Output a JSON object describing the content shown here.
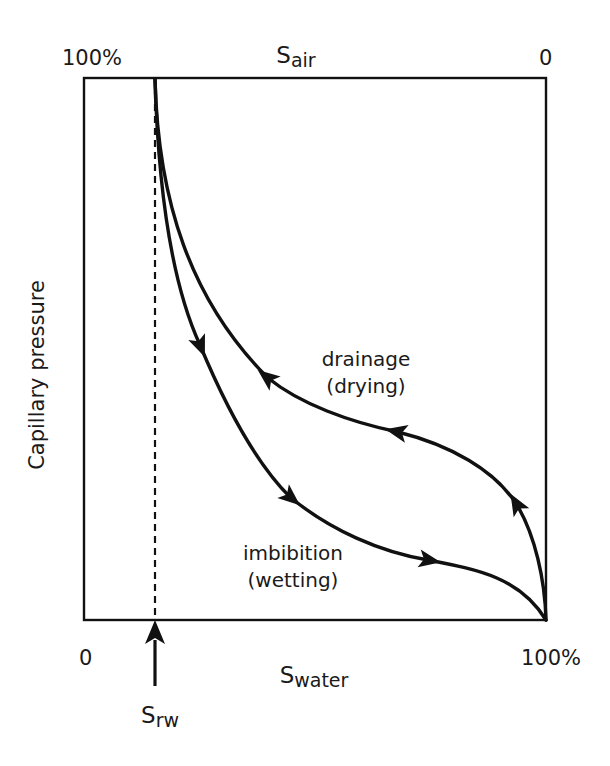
{
  "diagram": {
    "title": "",
    "y_axis_label": "Capillary pressure",
    "top_axis": {
      "symbol": "S",
      "subscript": "air",
      "left_value": "100%",
      "right_value": "0"
    },
    "bottom_axis": {
      "symbol": "S",
      "subscript": "water",
      "left_value": "0",
      "right_value": "100%"
    },
    "residual_marker": {
      "symbol": "S",
      "subscript": "rw",
      "style": "dashed vertical line with upward arrow"
    },
    "curves": [
      {
        "id": "drainage",
        "label_line1": "drainage",
        "label_line2": "(drying)",
        "direction": "from 100% water saturation toward residual saturation (arrows point up-left)"
      },
      {
        "id": "imbibition",
        "label_line1": "imbibition",
        "label_line2": "(wetting)",
        "direction": "from residual saturation toward 100% water saturation (arrows point down-right)"
      }
    ],
    "colors": {
      "line": "#111111",
      "background": "#ffffff"
    }
  }
}
